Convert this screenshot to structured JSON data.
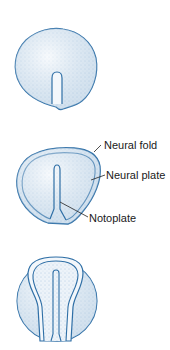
{
  "header": {
    "text": ""
  },
  "figure": {
    "stages": [
      {
        "id": "stage-1",
        "description": "Embryo disc with primitive notochordal process"
      },
      {
        "id": "stage-2",
        "description": "Embryo disc with neural fold, neural plate and notoplate"
      },
      {
        "id": "stage-3",
        "description": "Embryo disc with elevated neural folds"
      }
    ],
    "labels": {
      "neural_fold": "Neural fold",
      "neural_plate": "Neural plate",
      "notoplate": "Notoplate"
    },
    "colors": {
      "outline": "#2f6fa6",
      "fill": "#e6f0f8",
      "stipple": "#7aa7cc",
      "leader": "#222222"
    }
  }
}
